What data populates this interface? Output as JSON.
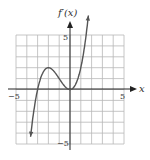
{
  "chart_data": {
    "type": "line",
    "title": "",
    "xlabel": "x",
    "ylabel": "f'(x)",
    "xlim": [
      -5,
      5
    ],
    "ylim": [
      -5,
      5
    ],
    "grid": true,
    "tick_labels": {
      "x": [
        "-5",
        "5"
      ],
      "y": [
        "5",
        "-5"
      ]
    },
    "series": [
      {
        "name": "f'(x)",
        "x": [
          -3.7,
          -3.5,
          -3,
          -2.5,
          -2,
          -1.5,
          -1,
          -0.5,
          0,
          0.5,
          1,
          1.5,
          1.8
        ],
        "values": [
          -4.79,
          -3.06,
          0,
          1.56,
          2,
          1.69,
          1,
          0.31,
          0,
          0.44,
          2,
          5.06,
          7.78
        ]
      }
    ]
  },
  "labels": {
    "y_axis": "f′(x)",
    "x_axis": "x",
    "x_min": "−5",
    "x_max": "5",
    "y_max": "5",
    "y_min": "−5"
  },
  "colors": {
    "curve": "#555555",
    "grid": "#b0b0b0",
    "axis": "#222222"
  }
}
